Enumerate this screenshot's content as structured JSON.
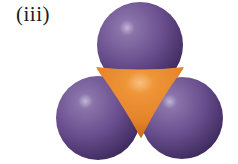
{
  "figure": {
    "label": "(iii)",
    "colors": {
      "outer_atom": "#6a4f8f",
      "outer_atom_highlight": "#b8a8d0",
      "outer_atom_shadow": "#3e2a5e",
      "central_atom": "#e8892a",
      "central_atom_highlight": "#f6b066",
      "central_atom_shadow": "#c96a14"
    },
    "atoms": [
      {
        "name": "top",
        "cx": 140,
        "cy": 45,
        "r": 43
      },
      {
        "name": "left",
        "cx": 98,
        "cy": 118,
        "r": 42
      },
      {
        "name": "right",
        "cx": 182,
        "cy": 118,
        "r": 41
      }
    ]
  }
}
